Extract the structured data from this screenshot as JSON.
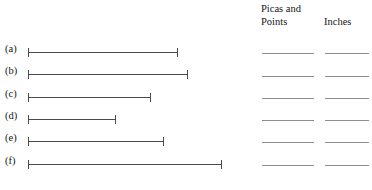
{
  "headings": {
    "picas_and_points": "Picas and\nPoints",
    "inches": "Inches"
  },
  "colors": {
    "rule": "#4a4a4a",
    "blank": "#8d8d8d",
    "text": "#151515",
    "background": "#ffffff"
  },
  "rows": [
    {
      "label": "(a)",
      "length_px": 150,
      "row_top": 42,
      "start_px": 28
    },
    {
      "label": "(b)",
      "label_text": "(b)",
      "length_px": 160,
      "row_top": 64,
      "start_px": 28
    },
    {
      "label": "(c)",
      "length_px": 123,
      "row_top": 87,
      "start_px": 28
    },
    {
      "label": "(d)",
      "length_px": 88,
      "row_top": 109,
      "start_px": 28
    },
    {
      "label": "(e)",
      "length_px": 136,
      "row_top": 131,
      "start_px": 28
    },
    {
      "label": "(f)",
      "length_px": 194,
      "row_top": 154,
      "start_px": 28
    }
  ],
  "answer_blanks": [
    {
      "row": "(a)",
      "picas_value": "",
      "inches_value": "",
      "y": 53
    },
    {
      "row": "(b)",
      "picas_value": "",
      "inches_value": "",
      "y": 76
    },
    {
      "row": "(c)",
      "picas_value": "",
      "inches_value": "",
      "y": 98
    },
    {
      "row": "(d)",
      "picas_value": "",
      "inches_value": "",
      "y": 120
    },
    {
      "row": "(e)",
      "picas_value": "",
      "inches_value": "",
      "y": 142
    },
    {
      "row": "(f)",
      "picas_value": "",
      "inches_value": "",
      "y": 165
    }
  ]
}
